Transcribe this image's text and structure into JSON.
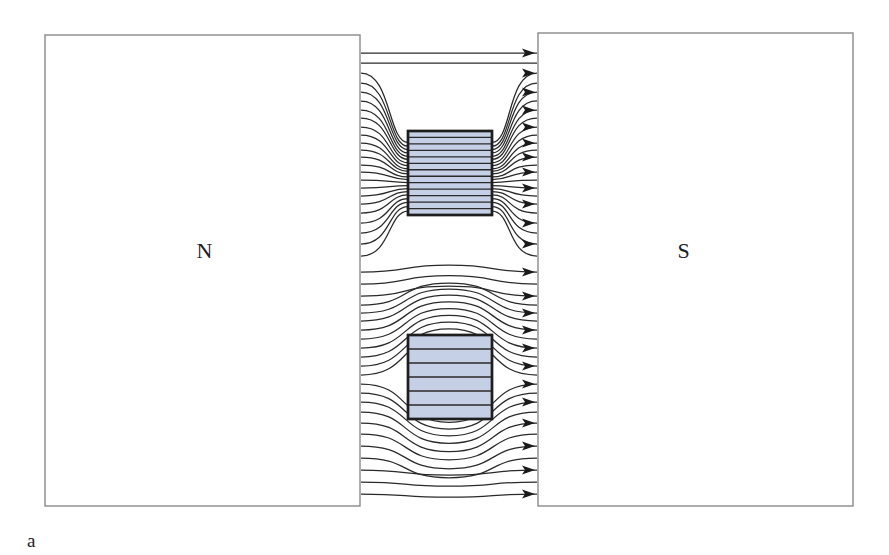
{
  "figure": {
    "caption_label": "a"
  },
  "poles": {
    "north": {
      "label": "N",
      "x": 45,
      "y": 35,
      "w": 315,
      "h": 471
    },
    "south": {
      "label": "S",
      "x": 538,
      "y": 33,
      "w": 315,
      "h": 473
    }
  },
  "samples": [
    {
      "name": "upper-sample",
      "x": 408,
      "y": 131,
      "w": 84,
      "h": 84,
      "fill": "#c5cfe6",
      "internal_lines": 13
    },
    {
      "name": "lower-sample",
      "x": 408,
      "y": 335,
      "w": 84,
      "h": 84,
      "fill": "#c5cfe6",
      "internal_lines": 6
    }
  ],
  "field": {
    "x_start": 361,
    "x_end": 537,
    "color": "#2a2a2a",
    "arrow_color": "#1a1a1a"
  },
  "colors": {
    "pole_border": "#8a8a8a",
    "sample_fill": "#c5cfe6",
    "sample_border": "#1e1e1e"
  }
}
